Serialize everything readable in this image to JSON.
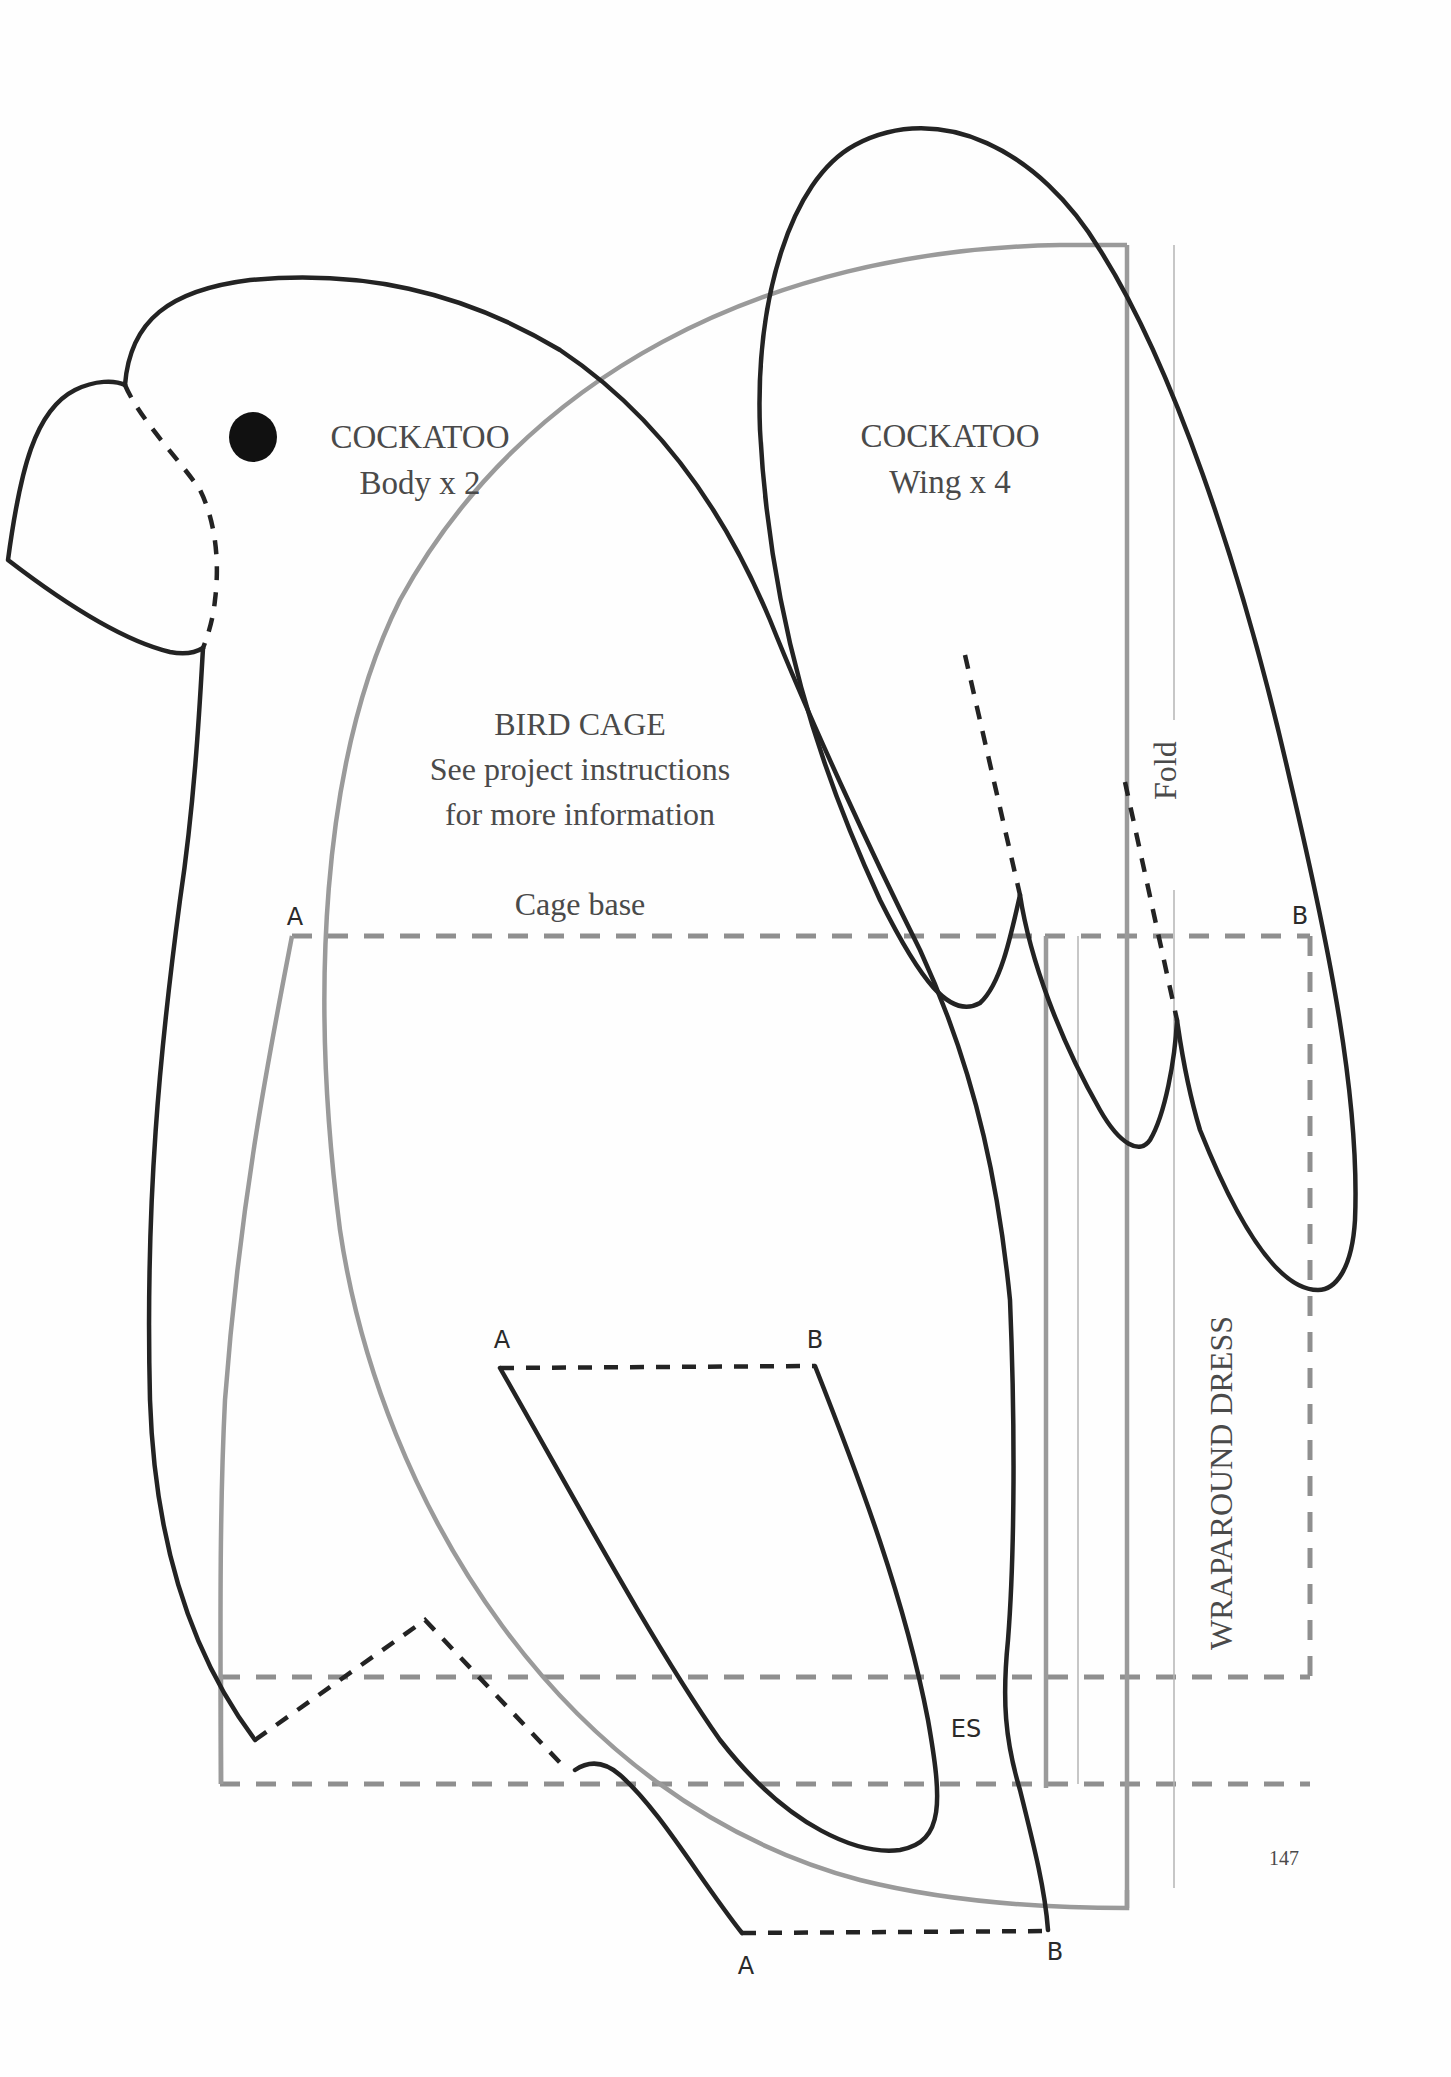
{
  "page": {
    "page_number": "147",
    "background": "#fefefe"
  },
  "cockatoo_body": {
    "title": "COCKATOO",
    "subtitle": "Body x 2",
    "eye_icon": "filled-circle"
  },
  "cockatoo_wing": {
    "title": "COCKATOO",
    "subtitle": "Wing x 4"
  },
  "bird_cage": {
    "title": "BIRD CAGE",
    "line1": "See project instructions",
    "line2": "for more information",
    "base_label": "Cage base",
    "point_a": "A",
    "point_b": "B"
  },
  "leg_piece": {
    "point_a": "A",
    "point_b": "B"
  },
  "foot_piece": {
    "point_a": "A",
    "point_b": "B"
  },
  "fold": {
    "label": "Fold"
  },
  "wraparound_dress": {
    "label": "WRAPAROUND DRESS",
    "es_label": "ES"
  },
  "colors": {
    "pattern_black": "#232323",
    "pattern_grey": "#9a9a9a",
    "text_grey": "#4a4a4a"
  }
}
